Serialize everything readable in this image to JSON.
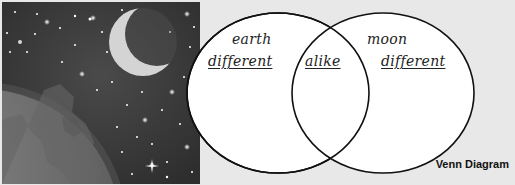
{
  "illustration": {
    "subject": "earth and crescent moon in starry space",
    "icons": [
      "earth-icon",
      "moon-icon",
      "star-icon"
    ]
  },
  "venn": {
    "left_circle": {
      "title": "earth",
      "region_label": "different"
    },
    "overlap": {
      "region_label": "alike"
    },
    "right_circle": {
      "title": "moon",
      "region_label": "different"
    },
    "caption": "Venn Diagram"
  },
  "colors": {
    "background": "#e8e8e8",
    "space": "#3a3a3a",
    "circle_fill": "#ffffff",
    "circle_stroke": "#111111",
    "text": "#222222"
  }
}
